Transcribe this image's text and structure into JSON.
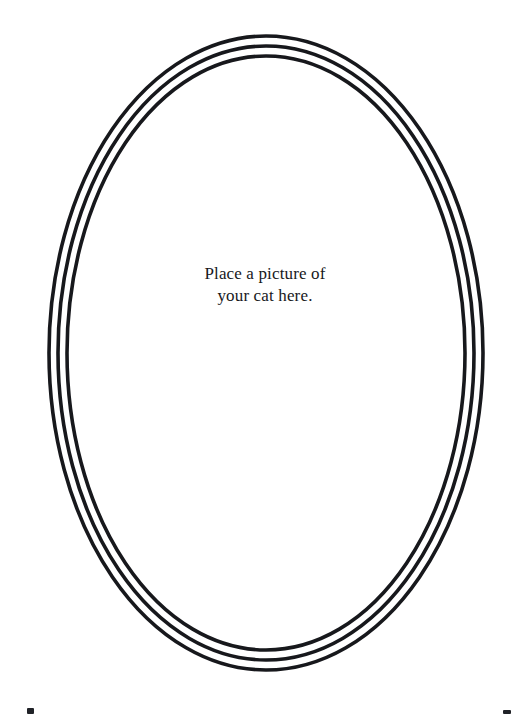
{
  "page": {
    "background_color": "#ffffff",
    "width": 530,
    "height": 714,
    "title": "Place a picture of your cat here."
  },
  "frame": {
    "name": "oval-photo-frame",
    "shape": "ellipse",
    "ring_count": 3,
    "stroke_color": "#17181c",
    "stroke_width": 3.6,
    "fill": "none",
    "center_x": 266,
    "center_y": 353,
    "rings": [
      {
        "label": "outer-ring",
        "rx": 217,
        "ry": 317
      },
      {
        "label": "middle-ring",
        "rx": 208,
        "ry": 307
      },
      {
        "label": "inner-ring",
        "rx": 199,
        "ry": 297
      }
    ]
  },
  "caption": {
    "color": "#17181c",
    "lines": [
      "Place a picture of",
      "your cat here."
    ]
  },
  "edge_marks": [
    {
      "label": "bottom-left-mark",
      "color": "#202227"
    },
    {
      "label": "bottom-right-mark",
      "color": "#202227"
    }
  ]
}
